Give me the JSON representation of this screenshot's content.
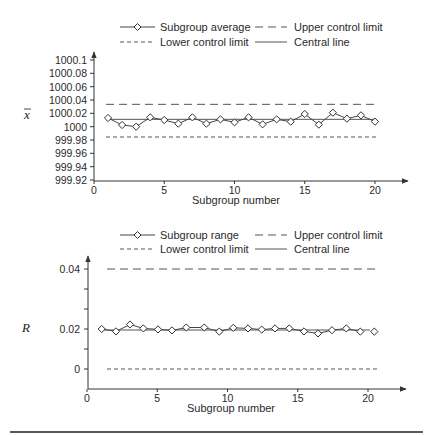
{
  "chart_data": [
    {
      "type": "line",
      "title": "",
      "xlabel": "Subgroup number",
      "ylabel": "x̄",
      "x": [
        1,
        2,
        3,
        4,
        5,
        6,
        7,
        8,
        9,
        10,
        11,
        12,
        13,
        14,
        15,
        16,
        17,
        18,
        19,
        20
      ],
      "xticks": [
        "0",
        "5",
        "10",
        "15",
        "20"
      ],
      "yticks": [
        "1000.1",
        "1000.08",
        "1000.06",
        "1000.04",
        "1000.02",
        "1000",
        "999.98",
        "999.96",
        "999.94",
        "999.92"
      ],
      "ylim": [
        999.92,
        1000.1
      ],
      "xlim": [
        0,
        22
      ],
      "grid": false,
      "legend_position": "top",
      "series": [
        {
          "name": "Subgroup average",
          "style": "solid-diamond",
          "values": [
            1000.013,
            1000.0025,
            1000.0,
            1000.014,
            1000.01,
            1000.0045,
            1000.014,
            1000.0045,
            1000.011,
            1000.0065,
            1000.014,
            1000.0035,
            1000.011,
            1000.0075,
            1000.019,
            1000.003,
            1000.021,
            1000.012,
            1000.017,
            1000.0075
          ]
        },
        {
          "name": "Upper control limit",
          "style": "long-dash",
          "value": 1000.0335
        },
        {
          "name": "Lower control limit",
          "style": "short-dash",
          "value": 999.9845
        },
        {
          "name": "Central line",
          "style": "solid",
          "value": 1000.011
        }
      ]
    },
    {
      "type": "line",
      "title": "",
      "xlabel": "Subgroup number",
      "ylabel": "R",
      "x": [
        1,
        2,
        3,
        4,
        5,
        6,
        7,
        8,
        9,
        10,
        11,
        12,
        13,
        14,
        15,
        16,
        17,
        18,
        19,
        20
      ],
      "xticks": [
        "0",
        "5",
        "10",
        "15",
        "20"
      ],
      "yticks": [
        "0.04",
        "0.02",
        "0"
      ],
      "ylim": [
        -0.004,
        0.045
      ],
      "xlim": [
        0,
        22
      ],
      "grid": false,
      "legend_position": "top",
      "series": [
        {
          "name": "Subgroup range",
          "style": "solid-diamond",
          "values": [
            0.02,
            0.0188,
            0.0215,
            0.0202,
            0.0198,
            0.0193,
            0.0205,
            0.0205,
            0.0187,
            0.0204,
            0.0202,
            0.0197,
            0.0202,
            0.0202,
            0.0188,
            0.0178,
            0.0194,
            0.0202,
            0.0187,
            0.0187
          ]
        },
        {
          "name": "Upper control limit",
          "style": "long-dash",
          "value": 0.04
        },
        {
          "name": "Lower control limit",
          "style": "short-dash",
          "value": 0.0
        },
        {
          "name": "Central line",
          "style": "solid",
          "value": 0.0195
        }
      ]
    }
  ],
  "charts": [
    {
      "legend": {
        "series": "Subgroup average",
        "ucl": "Upper control limit",
        "lcl": "Lower control limit",
        "cl": "Central line"
      },
      "ylabel": "x",
      "xlabel": "Subgroup number",
      "xticks": [
        "0",
        "5",
        "10",
        "15",
        "20"
      ],
      "yticks": [
        "1000.1",
        "1000.08",
        "1000.06",
        "1000.04",
        "1000.02",
        "1000",
        "999.98",
        "999.96",
        "999.94",
        "999.92"
      ]
    },
    {
      "legend": {
        "series": "Subgroup range",
        "ucl": "Upper control limit",
        "lcl": "Lower control limit",
        "cl": "Central line"
      },
      "ylabel": "R",
      "xlabel": "Subgroup number",
      "xticks": [
        "0",
        "5",
        "10",
        "15",
        "20"
      ],
      "yticks": [
        "0.04",
        "0.02",
        "0"
      ]
    }
  ]
}
